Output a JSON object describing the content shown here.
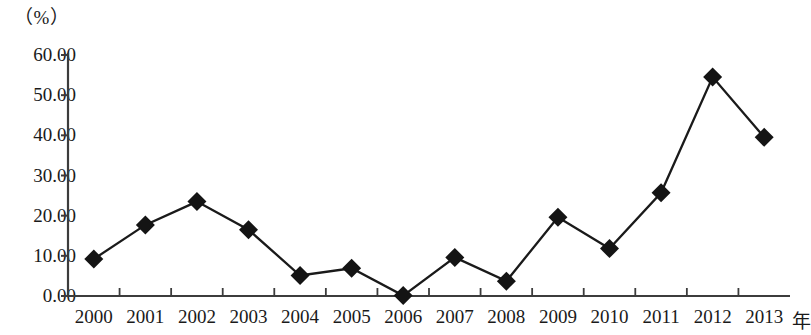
{
  "chart_data": {
    "type": "line",
    "title": "",
    "subtitle": "",
    "xlabel": "年",
    "ylabel": "（%）",
    "categories": [
      "2000",
      "2001",
      "2002",
      "2003",
      "2004",
      "2005",
      "2006",
      "2007",
      "2008",
      "2009",
      "2010",
      "2011",
      "2012",
      "2013"
    ],
    "series": [
      {
        "name": "",
        "values": [
          9.2,
          17.7,
          23.5,
          16.5,
          5.1,
          6.9,
          0.1,
          9.6,
          3.7,
          19.6,
          11.8,
          25.7,
          54.5,
          39.5
        ]
      }
    ],
    "ylim": [
      0,
      60
    ],
    "yticks": [
      0,
      10,
      20,
      30,
      40,
      50,
      60
    ],
    "ytick_labels": [
      "0.00",
      "10.00",
      "20.00",
      "30.00",
      "40.00",
      "50.00",
      "60.00"
    ],
    "grid": false,
    "legend": "none",
    "marker": "diamond",
    "line_color": "#1a1a1a",
    "marker_color": "#141414",
    "axis_color": "#3c3c3c"
  },
  "axes": {
    "y_unit_label": "（%）",
    "x_unit_label": "年"
  }
}
